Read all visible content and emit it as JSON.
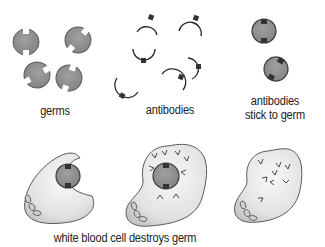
{
  "labels": {
    "germs": "germs",
    "antibodies": "antibodies",
    "stick_line1": "antibodies",
    "stick_line2": "stick to germ",
    "destroys": "white blood cell destroys germ"
  },
  "colors": {
    "germ_fill": "#8f8f8f",
    "germ_stroke": "#555555",
    "antibody_stroke": "#2a2a2a",
    "antibody_tip": "#333333",
    "cell_fill": "#e6e6e6",
    "cell_stroke": "#555555",
    "text": "#222222"
  },
  "panels": [
    {
      "id": "germs",
      "caption": "germs"
    },
    {
      "id": "antibodies",
      "caption": "antibodies"
    },
    {
      "id": "antibodies-stick",
      "caption": "antibodies stick to germ"
    },
    {
      "id": "engulf",
      "caption": ""
    },
    {
      "id": "digest",
      "caption": ""
    },
    {
      "id": "destroyed",
      "caption": ""
    }
  ]
}
